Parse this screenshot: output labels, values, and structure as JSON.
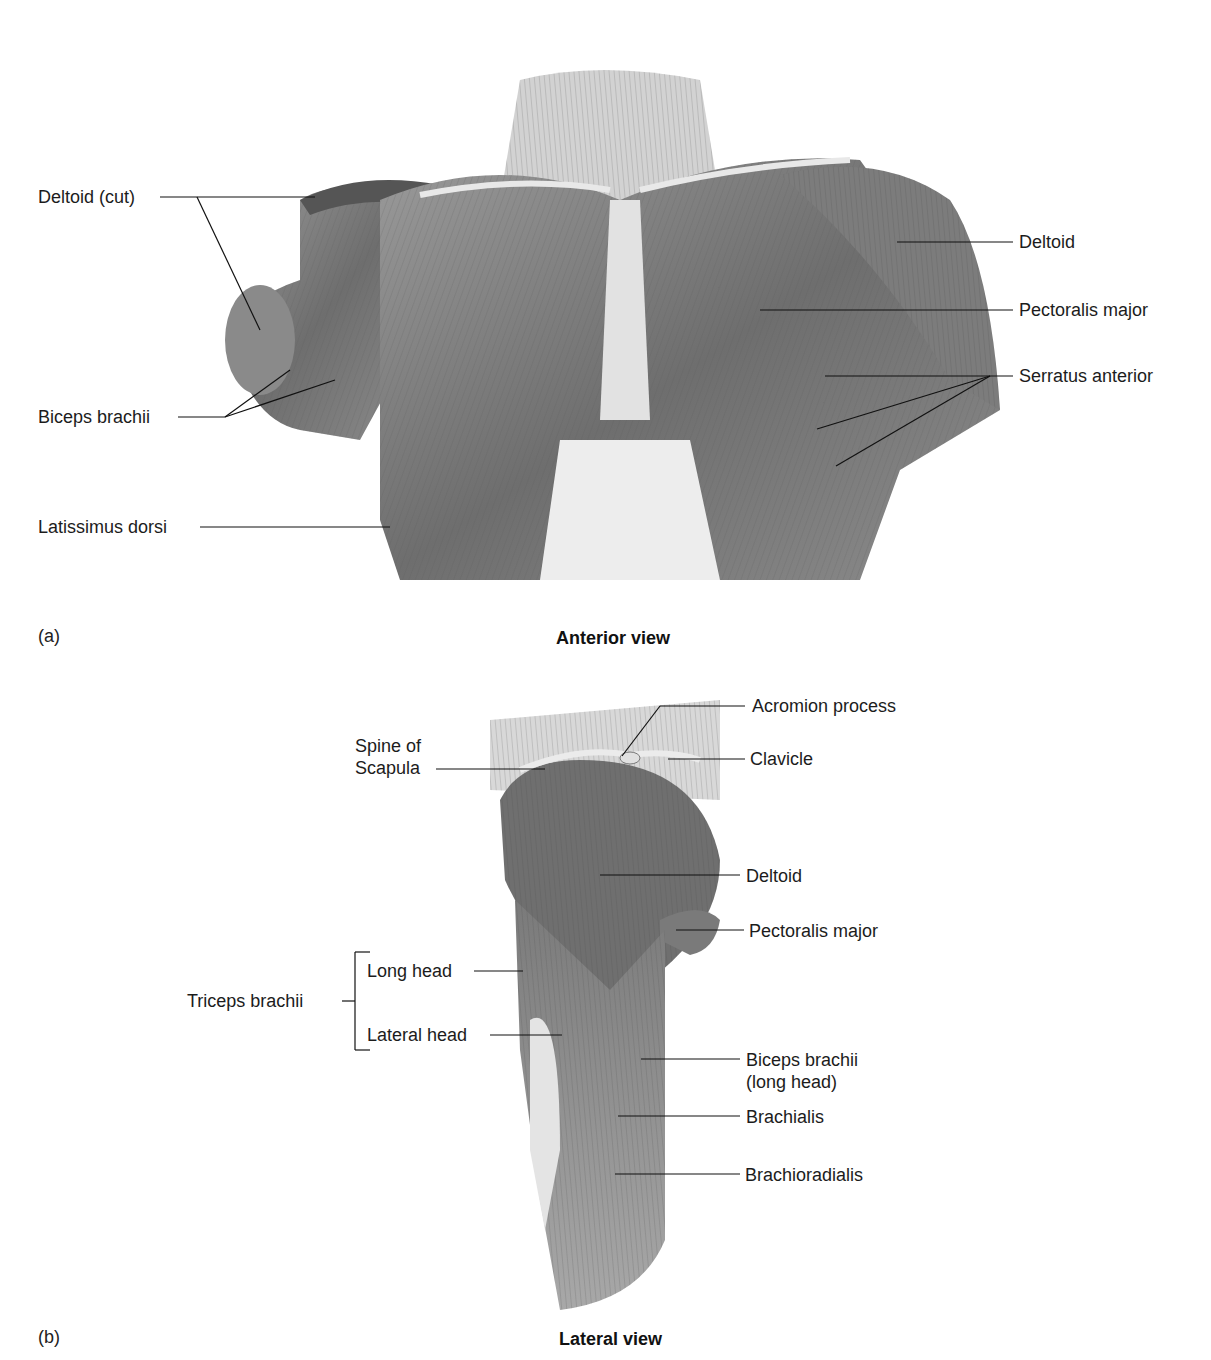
{
  "panels": [
    {
      "letter": "(a)",
      "caption": "Anterior view",
      "labels": {
        "deltoid_cut": "Deltoid (cut)",
        "biceps_brachii": "Biceps brachii",
        "latissimus_dorsi": "Latissimus dorsi",
        "deltoid": "Deltoid",
        "pectoralis_major": "Pectoralis major",
        "serratus_anterior": "Serratus anterior"
      }
    },
    {
      "letter": "(b)",
      "caption": "Lateral view",
      "labels": {
        "acromion_process": "Acromion process",
        "spine_of_scapula_1": "Spine of",
        "spine_of_scapula_2": "Scapula",
        "clavicle": "Clavicle",
        "deltoid": "Deltoid",
        "pectoralis_major": "Pectoralis major",
        "triceps_brachii": "Triceps brachii",
        "long_head": "Long head",
        "lateral_head": "Lateral head",
        "biceps_brachii_1": "Biceps brachii",
        "biceps_brachii_2": "(long head)",
        "brachialis": "Brachialis",
        "brachioradialis": "Brachioradialis"
      }
    }
  ]
}
